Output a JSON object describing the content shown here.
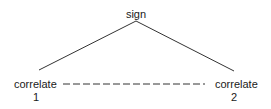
{
  "diagram": {
    "apex": {
      "label": "sign"
    },
    "left_node": {
      "label": "correlate",
      "index": "1"
    },
    "right_node": {
      "label": "correlate",
      "index": "2"
    },
    "edges": [
      {
        "from": "sign",
        "to": "correlate 1",
        "style": "solid"
      },
      {
        "from": "sign",
        "to": "correlate 2",
        "style": "solid"
      },
      {
        "from": "correlate 1",
        "to": "correlate 2",
        "style": "dashed"
      }
    ],
    "colors": {
      "line": "#333333",
      "text": "#1a1a1a",
      "background": "#ffffff"
    }
  }
}
